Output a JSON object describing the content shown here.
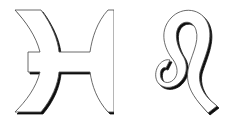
{
  "symbols": [
    {
      "name": "Pisces",
      "glyph": "♓"
    },
    {
      "name": "Leo",
      "glyph": "♌"
    }
  ],
  "colors": {
    "fill": "#ffffff",
    "stroke": "#555555",
    "shadow": "#111111",
    "background": "#ffffff"
  }
}
